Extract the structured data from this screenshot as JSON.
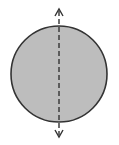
{
  "diagram": {
    "shape": "circle",
    "colors": {
      "fill": "#bdbdbd",
      "stroke": "#333333",
      "axis": "#333333",
      "background": "#ffffff"
    },
    "circle": {
      "cx": 59,
      "cy": 74,
      "r": 48
    },
    "axis": {
      "style": "dashed",
      "x": 59,
      "y_top": 10,
      "y_bottom": 136,
      "arrowheads": [
        "up-arrow",
        "down-arrow"
      ]
    }
  }
}
